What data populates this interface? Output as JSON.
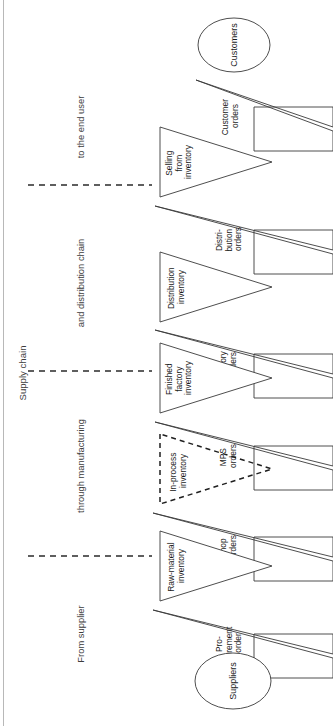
{
  "diagram": {
    "title": "Supply chain",
    "orientation": "rotated-90",
    "sections": [
      {
        "id": "from-supplier",
        "label": "From supplier"
      },
      {
        "id": "through-manufacturing",
        "label": "through manufacturing"
      },
      {
        "id": "and-distribution-chain",
        "label": "and distribution chain"
      },
      {
        "id": "to-the-end-user",
        "label": "to the end user"
      }
    ],
    "nodes": [
      {
        "id": "customers",
        "label": "Customers",
        "shape": "ellipse"
      },
      {
        "id": "suppliers",
        "label": "Suppliers",
        "shape": "ellipse"
      }
    ],
    "order_arrows": [
      {
        "id": "customer-orders",
        "lines": [
          "Customer",
          "orders"
        ],
        "style": "solid"
      },
      {
        "id": "distribution-orders",
        "lines": [
          "Distri-",
          "bution",
          "orders"
        ],
        "style": "solid"
      },
      {
        "id": "factory-orders",
        "lines": [
          "Factory",
          "orders"
        ],
        "style": "solid"
      },
      {
        "id": "mps-orders",
        "lines": [
          "MPS",
          "orders"
        ],
        "style": "solid"
      },
      {
        "id": "shop-orders",
        "lines": [
          "Shop",
          "orders"
        ],
        "style": "solid"
      },
      {
        "id": "procurement-order",
        "lines": [
          "Pro-",
          "curement",
          "order"
        ],
        "style": "solid"
      }
    ],
    "inventory_triangles": [
      {
        "id": "selling-from-inventory",
        "lines": [
          "Selling",
          "from",
          "inventory"
        ],
        "style": "solid"
      },
      {
        "id": "distribution-inventory",
        "lines": [
          "Distribution",
          "inventory"
        ],
        "style": "solid"
      },
      {
        "id": "finished-factory-inventory",
        "lines": [
          "Finished",
          "factory",
          "inventory"
        ],
        "style": "solid"
      },
      {
        "id": "in-process-inventory",
        "lines": [
          "In-process",
          "inventory"
        ],
        "style": "dashed"
      },
      {
        "id": "raw-material-inventory",
        "lines": [
          "Raw-material",
          "inventory"
        ],
        "style": "solid"
      }
    ],
    "colors": {
      "stroke": "#3a3a3a",
      "dashed_stroke": "#1f1f1f",
      "text": "#1a1a1a",
      "background": "#ffffff"
    }
  }
}
